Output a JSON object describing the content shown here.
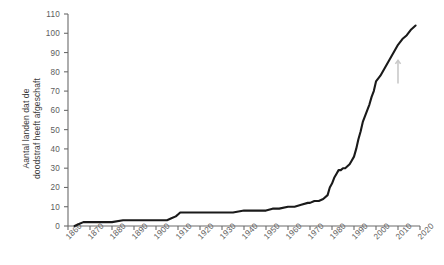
{
  "chart_data": {
    "type": "line",
    "title": "",
    "xlabel": "",
    "ylabel": "Aantal landen dat de\ndoodstraf heeft afgeschaft",
    "xlim": [
      1860,
      2020
    ],
    "ylim": [
      0,
      110
    ],
    "grid": false,
    "legend": "none",
    "line_color": "#1a1a1a",
    "axis_color": "#6b6b6b",
    "label_color": "#5d5d5d",
    "annotation_color": "#c9c9c9",
    "xticks": [
      "1860",
      "1870",
      "1880",
      "1890",
      "1900",
      "1910",
      "1920",
      "1930",
      "1940",
      "1950",
      "1960",
      "1970",
      "1980",
      "1990",
      "2000",
      "2010",
      "2020"
    ],
    "yticks": [
      "0",
      "10",
      "20",
      "30",
      "40",
      "50",
      "60",
      "70",
      "80",
      "90",
      "100",
      "110"
    ],
    "series": [
      {
        "name": "Aantal landen dat de doodstraf heeft afgeschaft",
        "x": [
          1863,
          1865,
          1867,
          1870,
          1875,
          1880,
          1885,
          1890,
          1895,
          1900,
          1903,
          1905,
          1907,
          1909,
          1910,
          1911,
          1915,
          1920,
          1925,
          1930,
          1935,
          1940,
          1945,
          1948,
          1950,
          1953,
          1956,
          1960,
          1963,
          1966,
          1969,
          1970,
          1972,
          1974,
          1976,
          1978,
          1979,
          1980,
          1981,
          1982,
          1983,
          1984,
          1985,
          1986,
          1987,
          1988,
          1989,
          1990,
          1991,
          1992,
          1993,
          1994,
          1995,
          1996,
          1997,
          1998,
          1999,
          2000,
          2002,
          2004,
          2006,
          2008,
          2010,
          2012,
          2014,
          2016,
          2018
        ],
        "y": [
          0,
          1,
          2,
          2,
          2,
          2,
          3,
          3,
          3,
          3,
          3,
          3,
          4,
          5,
          6,
          7,
          7,
          7,
          7,
          7,
          7,
          8,
          8,
          8,
          8,
          9,
          9,
          10,
          10,
          11,
          12,
          12,
          13,
          13,
          14,
          16,
          20,
          22,
          25,
          27,
          29,
          29,
          30,
          30,
          31,
          32,
          34,
          36,
          40,
          45,
          49,
          54,
          57,
          60,
          63,
          67,
          70,
          75,
          78,
          82,
          86,
          90,
          94,
          97,
          99,
          102,
          104
        ]
      }
    ],
    "annotations": [
      {
        "name": "up-arrow-mark",
        "x": 2010,
        "y_from": 74,
        "y_to": 86
      }
    ]
  }
}
